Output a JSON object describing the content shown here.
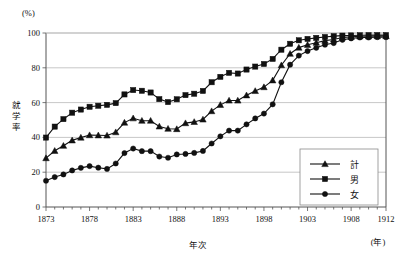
{
  "chart_data": {
    "type": "line",
    "title": "",
    "xlabel": "年次",
    "ylabel": "就学率",
    "yunit": "(%)",
    "xunit": "(年)",
    "xlim": [
      1873,
      1912
    ],
    "ylim": [
      0,
      100
    ],
    "yticks": [
      0,
      20,
      40,
      60,
      80,
      100
    ],
    "ytick_labels": [
      "0",
      "20",
      "40",
      "60",
      "80",
      "100"
    ],
    "xticks": [
      1873,
      1878,
      1883,
      1888,
      1893,
      1898,
      1903,
      1908,
      1912
    ],
    "xtick_labels": [
      "1873",
      "1878",
      "1883",
      "1888",
      "1893",
      "1898",
      "1903",
      "1908",
      "1912"
    ],
    "minor_xticks_every": 1,
    "grid": "horizontal",
    "legend_position": "bottom-right",
    "x": [
      1873,
      1874,
      1875,
      1876,
      1877,
      1878,
      1879,
      1880,
      1881,
      1882,
      1883,
      1884,
      1885,
      1886,
      1887,
      1888,
      1889,
      1890,
      1891,
      1892,
      1893,
      1894,
      1895,
      1896,
      1897,
      1898,
      1899,
      1900,
      1901,
      1902,
      1903,
      1904,
      1905,
      1906,
      1907,
      1908,
      1909,
      1910,
      1911,
      1912
    ],
    "series": [
      {
        "name": "計",
        "marker": "triangle",
        "values": [
          28.1,
          32.3,
          35.2,
          38.3,
          39.9,
          41.3,
          41.2,
          41.1,
          43.0,
          48.5,
          51.0,
          49.6,
          49.6,
          46.3,
          45.0,
          44.8,
          48.2,
          48.9,
          50.3,
          55.1,
          58.7,
          61.2,
          61.2,
          64.2,
          66.7,
          68.9,
          72.8,
          81.5,
          88.1,
          91.6,
          93.2,
          94.4,
          95.6,
          96.3,
          97.4,
          97.8,
          98.1,
          98.1,
          98.2,
          98.2
        ]
      },
      {
        "name": "男",
        "marker": "square",
        "values": [
          39.9,
          46.2,
          50.5,
          54.2,
          56.0,
          57.6,
          58.2,
          58.7,
          59.7,
          64.7,
          67.2,
          66.8,
          65.8,
          62.0,
          60.3,
          61.9,
          64.3,
          65.1,
          66.7,
          71.7,
          74.8,
          77.1,
          76.7,
          79.0,
          80.7,
          82.2,
          85.1,
          90.4,
          93.8,
          95.8,
          96.6,
          97.2,
          97.7,
          98.2,
          98.5,
          98.6,
          98.7,
          98.8,
          98.8,
          98.8
        ]
      },
      {
        "name": "女",
        "marker": "circle",
        "values": [
          15.1,
          17.2,
          18.7,
          21.0,
          22.5,
          23.5,
          22.6,
          21.9,
          25.0,
          31.0,
          33.6,
          32.1,
          32.1,
          29.0,
          28.3,
          30.2,
          30.5,
          31.1,
          32.2,
          36.5,
          40.6,
          43.9,
          43.9,
          47.5,
          50.9,
          53.7,
          59.0,
          71.7,
          81.8,
          87.0,
          89.6,
          91.5,
          93.3,
          94.2,
          96.1,
          96.9,
          97.4,
          97.4,
          97.6,
          97.6
        ]
      }
    ]
  },
  "legend": {
    "items": [
      {
        "label": "計",
        "marker": "triangle"
      },
      {
        "label": "男",
        "marker": "square"
      },
      {
        "label": "女",
        "marker": "circle"
      }
    ]
  }
}
